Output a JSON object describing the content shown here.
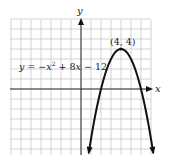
{
  "chart_data": {
    "type": "line",
    "title": "",
    "xlabel": "x",
    "ylabel": "y",
    "xlim": [
      -7,
      7
    ],
    "ylim": [
      -6.6,
      7
    ],
    "grid": true,
    "grid_step": 1,
    "series": [
      {
        "name": "y = −x² + 8x − 12",
        "equation": "y = -x^2 + 8x - 12",
        "x": [
          1,
          2,
          3,
          4,
          5,
          6,
          7
        ],
        "values": [
          -5,
          0,
          3,
          4,
          3,
          0,
          -5
        ]
      }
    ],
    "annotations": [
      {
        "text": "(4, 4)",
        "x": 4,
        "y": 4,
        "kind": "vertex"
      },
      {
        "text": "y = −x² + 8x − 12",
        "kind": "equation-label"
      }
    ]
  },
  "labels": {
    "x_axis": "x",
    "y_axis": "y",
    "vertex": "(4, 4)",
    "eq_y": "y",
    "eq_eq": " = −",
    "eq_x": "x",
    "eq_sup": "2",
    "eq_plus": " + 8",
    "eq_x2": "x",
    "eq_tail": " − 12"
  },
  "colors": {
    "grid": "#c8c8c8",
    "axis": "#2a2a2a",
    "curve": "#111111",
    "background": "#ffffff"
  }
}
